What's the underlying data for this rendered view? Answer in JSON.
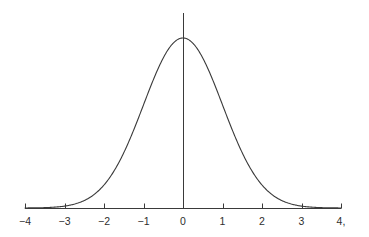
{
  "figure": {
    "title": "",
    "background_color": "#ffffff",
    "width": 369,
    "height": 237
  },
  "axis": {
    "name": "x-axis",
    "color": "#3a3a3a",
    "line_width": 1,
    "baseline_y": 208,
    "x_start_px": 25,
    "x_end_px": 341,
    "tick_length": 5,
    "tick_direction": "up"
  },
  "vertical_line": {
    "name": "y-axis-center-line",
    "color": "#3a3a3a",
    "line_width": 1,
    "x_value": 0,
    "top_y": 13,
    "bottom_y": 208
  },
  "curve": {
    "name": "gaussian-density-curve",
    "color": "#3a3a3a",
    "line_width": 1.1,
    "mean": 0,
    "sigma": 1,
    "peak_y_px": 38,
    "baseline_y_px": 208
  },
  "labels": {
    "tick_texts": [
      "−4",
      "−3",
      "−2",
      "−1",
      "0",
      "1",
      "2",
      "3",
      "4,"
    ],
    "label_y_px": 215,
    "color": "#2e2e2e",
    "font_size_px": 10.5
  },
  "chart_data": {
    "type": "line",
    "title": "",
    "subtitle": "",
    "xlabel": "",
    "ylabel": "",
    "xlim": [
      -4,
      4
    ],
    "ylim": [
      0,
      0.4
    ],
    "xticks": [
      -4,
      -3,
      -2,
      -1,
      0,
      1,
      2,
      3,
      4
    ],
    "xticklabels": [
      "−4",
      "−3",
      "−2",
      "−1",
      "0",
      "1",
      "2",
      "3",
      "4,"
    ],
    "yticks": [],
    "yticklabels": [],
    "grid": false,
    "legend": false,
    "legend_position": "none",
    "annotations": [],
    "series": [
      {
        "name": "standard normal density",
        "formula": "y = exp(-x^2/2) / sqrt(2*pi)",
        "color": "#3a3a3a",
        "x": [
          -4,
          -3.75,
          -3.5,
          -3.25,
          -3,
          -2.75,
          -2.5,
          -2.25,
          -2,
          -1.75,
          -1.5,
          -1.25,
          -1,
          -0.75,
          -0.5,
          -0.25,
          0,
          0.25,
          0.5,
          0.75,
          1,
          1.25,
          1.5,
          1.75,
          2,
          2.25,
          2.5,
          2.75,
          3,
          3.25,
          3.5,
          3.75,
          4
        ],
        "y": [
          0.0001,
          0.0004,
          0.0009,
          0.002,
          0.0044,
          0.0091,
          0.0175,
          0.0317,
          0.054,
          0.0863,
          0.1295,
          0.1826,
          0.242,
          0.3011,
          0.3521,
          0.3867,
          0.3989,
          0.3867,
          0.3521,
          0.3011,
          0.242,
          0.1826,
          0.1295,
          0.0863,
          0.054,
          0.0317,
          0.0175,
          0.0091,
          0.0044,
          0.002,
          0.0009,
          0.0004,
          0.0001
        ]
      }
    ],
    "vertical_line_at_x": 0
  }
}
